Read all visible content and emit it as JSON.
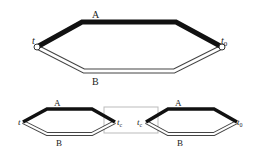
{
  "top": {
    "label_a": "A",
    "label_b": "B",
    "start": "t",
    "end_base": "t",
    "end_sub": "0"
  },
  "bottom_left": {
    "label_a": "A",
    "label_b": "B",
    "start": "t",
    "end_base": "t",
    "end_sub": "c"
  },
  "bottom_right": {
    "label_a": "A",
    "label_b": "B",
    "start_base": "t",
    "start_sub": "c",
    "end_base": "t",
    "end_sub": "0"
  },
  "colors": {
    "path_a": "#111111",
    "path_b_outline": "#444444",
    "connector_box": "#bbbbbb"
  }
}
